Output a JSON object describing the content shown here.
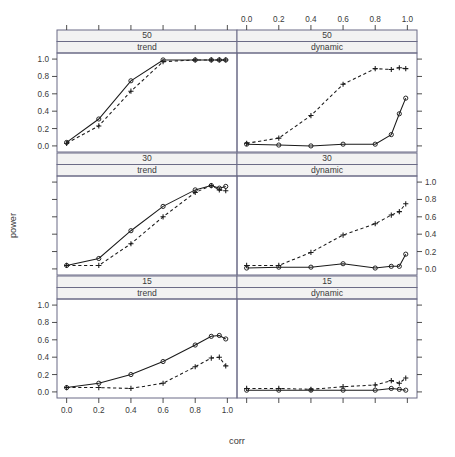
{
  "figure": {
    "xlabel": "corr",
    "ylabel": "power",
    "x_ticks": [
      "0.0",
      "0.2",
      "0.4",
      "0.6",
      "0.8",
      "1.0"
    ],
    "y_ticks": [
      "0.0",
      "0.2",
      "0.4",
      "0.6",
      "0.8",
      "1.0"
    ],
    "strip_rows": [
      "50",
      "30",
      "15"
    ],
    "strip_cols": [
      "trend",
      "dynamic"
    ],
    "colors": {
      "line": "#1a1a1a",
      "panel_border": "#6b6b86",
      "strip_fill": "#f2f2f2",
      "text": "#3a3a3a"
    }
  },
  "chart_data": {
    "type": "line",
    "title": "",
    "xlabel": "corr",
    "ylabel": "power",
    "xlim": [
      -0.06,
      1.06
    ],
    "ylim": [
      -0.07,
      1.07
    ],
    "x_ticks": [
      0.0,
      0.2,
      0.4,
      0.6,
      0.8,
      1.0
    ],
    "y_ticks": [
      0.0,
      0.2,
      0.4,
      0.6,
      0.8,
      1.0
    ],
    "grid": false,
    "legend": "none",
    "layout": {
      "rows": 3,
      "cols": 2,
      "row_strips": [
        "50",
        "30",
        "15"
      ],
      "col_strips": [
        "trend",
        "dynamic"
      ]
    },
    "x": [
      0.0,
      0.2,
      0.4,
      0.6,
      0.8,
      0.9,
      0.95,
      0.99
    ],
    "panels": [
      {
        "row_label": "50",
        "col_label": "trend",
        "row": 0,
        "col": 0,
        "series": [
          {
            "name": "circle-solid",
            "marker": "circle",
            "linestyle": "solid",
            "values": [
              0.04,
              0.31,
              0.75,
              0.99,
              0.99,
              0.99,
              0.99,
              0.99
            ]
          },
          {
            "name": "plus-dashed",
            "marker": "plus",
            "linestyle": "dashed",
            "values": [
              0.03,
              0.23,
              0.63,
              0.97,
              0.99,
              0.99,
              0.99,
              0.99
            ]
          }
        ]
      },
      {
        "row_label": "50",
        "col_label": "dynamic",
        "row": 0,
        "col": 1,
        "series": [
          {
            "name": "circle-solid",
            "marker": "circle",
            "linestyle": "solid",
            "values": [
              0.02,
              0.01,
              0.0,
              0.02,
              0.02,
              0.13,
              0.37,
              0.55
            ]
          },
          {
            "name": "plus-dashed",
            "marker": "plus",
            "linestyle": "dashed",
            "values": [
              0.03,
              0.09,
              0.35,
              0.71,
              0.89,
              0.88,
              0.9,
              0.89
            ]
          }
        ]
      },
      {
        "row_label": "30",
        "col_label": "trend",
        "row": 1,
        "col": 0,
        "series": [
          {
            "name": "circle-solid",
            "marker": "circle",
            "linestyle": "solid",
            "values": [
              0.04,
              0.12,
              0.44,
              0.72,
              0.91,
              0.96,
              0.93,
              0.95
            ]
          },
          {
            "name": "plus-dashed",
            "marker": "plus",
            "linestyle": "dashed",
            "values": [
              0.04,
              0.04,
              0.29,
              0.6,
              0.88,
              0.96,
              0.91,
              0.9
            ]
          }
        ]
      },
      {
        "row_label": "30",
        "col_label": "dynamic",
        "row": 1,
        "col": 1,
        "series": [
          {
            "name": "circle-solid",
            "marker": "circle",
            "linestyle": "solid",
            "values": [
              0.01,
              0.02,
              0.02,
              0.06,
              0.01,
              0.03,
              0.03,
              0.17
            ]
          },
          {
            "name": "plus-dashed",
            "marker": "plus",
            "linestyle": "dashed",
            "values": [
              0.04,
              0.04,
              0.19,
              0.39,
              0.52,
              0.62,
              0.66,
              0.75
            ]
          }
        ]
      },
      {
        "row_label": "15",
        "col_label": "trend",
        "row": 2,
        "col": 0,
        "series": [
          {
            "name": "circle-solid",
            "marker": "circle",
            "linestyle": "solid",
            "values": [
              0.05,
              0.1,
              0.2,
              0.35,
              0.54,
              0.64,
              0.65,
              0.61
            ]
          },
          {
            "name": "plus-dashed",
            "marker": "plus",
            "linestyle": "dashed",
            "values": [
              0.05,
              0.05,
              0.04,
              0.1,
              0.29,
              0.39,
              0.4,
              0.3
            ]
          }
        ]
      },
      {
        "row_label": "15",
        "col_label": "dynamic",
        "row": 2,
        "col": 1,
        "series": [
          {
            "name": "circle-solid",
            "marker": "circle",
            "linestyle": "solid",
            "values": [
              0.02,
              0.02,
              0.02,
              0.02,
              0.02,
              0.04,
              0.03,
              0.02
            ]
          },
          {
            "name": "plus-dashed",
            "marker": "plus",
            "linestyle": "dashed",
            "values": [
              0.04,
              0.04,
              0.03,
              0.06,
              0.08,
              0.13,
              0.1,
              0.16
            ]
          }
        ]
      }
    ]
  }
}
